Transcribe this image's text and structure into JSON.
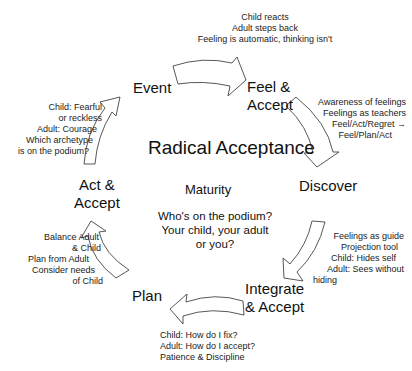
{
  "title": "Radical Acceptance",
  "center": {
    "subtitle": "Maturity",
    "question_lines": [
      "Who's on the podium?",
      "Your child, your adult",
      "or you?"
    ]
  },
  "stages": [
    {
      "id": "event",
      "lines": [
        "Event"
      ]
    },
    {
      "id": "feel-accept",
      "lines": [
        "Feel &",
        "Accept"
      ]
    },
    {
      "id": "discover",
      "lines": [
        "Discover"
      ]
    },
    {
      "id": "integrate-accept",
      "lines": [
        "Integrate",
        "& Accept"
      ]
    },
    {
      "id": "plan",
      "lines": [
        "Plan"
      ]
    },
    {
      "id": "act-accept",
      "lines": [
        "Act &",
        "Accept"
      ]
    }
  ],
  "notes": {
    "event_to_feel": [
      "Child reacts",
      "Adult steps back",
      "Feeling is automatic, thinking isn't"
    ],
    "feel_to_discover": [
      "Awareness of feelings",
      "Feelings as teachers",
      "Feel/Act/Regret →",
      "Feel/Plan/Act"
    ],
    "discover_to_integrate": [
      "Feelings as guide",
      "Projection tool",
      "Child: Hides self",
      "Adult: Sees without",
      "hiding"
    ],
    "integrate_to_plan": [
      "Child: How do I fix?",
      "Adult: How do I accept?",
      "Patience & Discipline"
    ],
    "plan_to_act": [
      "Balance Adult",
      "& Child",
      "Plan from Adult",
      "Consider needs",
      "of Child"
    ],
    "act_to_event": [
      "Child: Fearful",
      "or reckless",
      "Adult: Courage",
      "Which archetype",
      "is on the podium?"
    ]
  },
  "arrows": [
    {
      "from": "event",
      "to": "feel-accept",
      "icon": "curved-arrow-icon"
    },
    {
      "from": "feel-accept",
      "to": "discover",
      "icon": "curved-arrow-icon"
    },
    {
      "from": "discover",
      "to": "integrate-accept",
      "icon": "curved-arrow-icon"
    },
    {
      "from": "integrate-accept",
      "to": "plan",
      "icon": "curved-arrow-icon"
    },
    {
      "from": "plan",
      "to": "act-accept",
      "icon": "curved-arrow-icon"
    },
    {
      "from": "act-accept",
      "to": "event",
      "icon": "curved-arrow-icon"
    }
  ]
}
